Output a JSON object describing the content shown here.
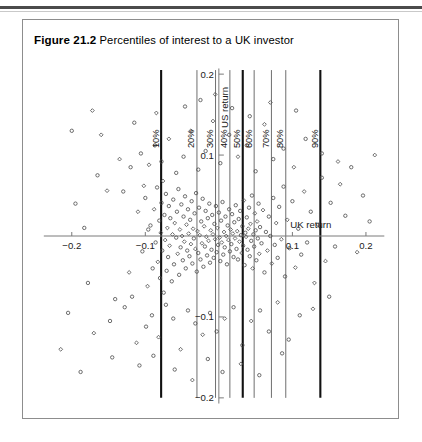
{
  "figure": {
    "caption_label": "Figure 21.2",
    "caption_text": "Percentiles of interest to a UK investor"
  },
  "chart_data": {
    "type": "scatter",
    "title": "Percentiles of interest to a UK investor",
    "xlabel": "UK return",
    "ylabel": "US return",
    "xlim": [
      -0.25,
      0.23
    ],
    "ylim": [
      -0.215,
      0.215
    ],
    "grid": false,
    "legend": null,
    "xticks": [
      -0.2,
      -0.1,
      0.1,
      0.2
    ],
    "xtick_labels": [
      "−0.2",
      "−0.1",
      "0.1",
      "0.2"
    ],
    "yticks": [
      0.2,
      0.1,
      -0.1,
      -0.2
    ],
    "ytick_labels": [
      "0.2",
      "0.1",
      "−0.1",
      "−0.2"
    ],
    "annotations": [
      {
        "label": "10%",
        "x": -0.0785,
        "emphasis": "thick"
      },
      {
        "label": "20%",
        "x": -0.0298,
        "emphasis": "thin"
      },
      {
        "label": "30%",
        "x": -0.0045,
        "emphasis": "thin"
      },
      {
        "label": "40%",
        "x": 0.015,
        "emphasis": "thin"
      },
      {
        "label": "50%",
        "x": 0.0325,
        "emphasis": "thick"
      },
      {
        "label": "60%",
        "x": 0.048,
        "emphasis": "thin"
      },
      {
        "label": "70%",
        "x": 0.0715,
        "emphasis": "thin"
      },
      {
        "label": "80%",
        "x": 0.091,
        "emphasis": "thin"
      },
      {
        "label": "90%",
        "x": 0.138,
        "emphasis": "thick"
      }
    ],
    "percentile_lines_ymin": -0.2,
    "percentile_lines_ymax": 0.205,
    "points": [
      [
        -0.152,
        0.056
      ],
      [
        -0.141,
        -0.078
      ],
      [
        -0.118,
        -0.075
      ],
      [
        -0.11,
        0.03
      ],
      [
        -0.104,
        -0.019
      ],
      [
        -0.1,
        0.047
      ],
      [
        -0.097,
        -0.062
      ],
      [
        -0.093,
        0.013
      ],
      [
        -0.09,
        -0.04
      ],
      [
        -0.088,
        0.033
      ],
      [
        -0.086,
        -0.008
      ],
      [
        -0.084,
        0.06
      ],
      [
        -0.083,
        -0.032
      ],
      [
        -0.081,
        0.019
      ],
      [
        -0.08,
        -0.052
      ],
      [
        -0.079,
        0.004
      ],
      [
        -0.078,
        0.041
      ],
      [
        -0.077,
        -0.018
      ],
      [
        -0.076,
        0.068
      ],
      [
        -0.075,
        -0.07
      ],
      [
        -0.074,
        0.026
      ],
      [
        -0.073,
        -0.005
      ],
      [
        -0.072,
        0.052
      ],
      [
        -0.071,
        -0.043
      ],
      [
        -0.07,
        0.01
      ],
      [
        -0.069,
        -0.026
      ],
      [
        -0.068,
        0.037
      ],
      [
        -0.067,
        -0.012
      ],
      [
        -0.066,
        0.022
      ],
      [
        -0.064,
        -0.056
      ],
      [
        -0.063,
        0.002
      ],
      [
        -0.062,
        0.045
      ],
      [
        -0.061,
        -0.035
      ],
      [
        -0.06,
        0.016
      ],
      [
        -0.058,
        -0.002
      ],
      [
        -0.057,
        0.03
      ],
      [
        -0.056,
        -0.022
      ],
      [
        -0.055,
        0.058
      ],
      [
        -0.054,
        -0.048
      ],
      [
        -0.053,
        0.008
      ],
      [
        -0.052,
        -0.014
      ],
      [
        -0.051,
        0.039
      ],
      [
        -0.05,
        0.0
      ],
      [
        -0.049,
        -0.03
      ],
      [
        -0.048,
        0.024
      ],
      [
        -0.047,
        -0.007
      ],
      [
        -0.046,
        0.049
      ],
      [
        -0.045,
        -0.04
      ],
      [
        -0.044,
        0.014
      ],
      [
        -0.043,
        -0.018
      ],
      [
        -0.042,
        0.033
      ],
      [
        -0.041,
        0.003
      ],
      [
        -0.04,
        -0.025
      ],
      [
        -0.039,
        0.02
      ],
      [
        -0.038,
        -0.01
      ],
      [
        -0.037,
        0.043
      ],
      [
        -0.036,
        -0.034
      ],
      [
        -0.035,
        0.009
      ],
      [
        -0.034,
        -0.003
      ],
      [
        -0.033,
        0.028
      ],
      [
        -0.032,
        -0.016
      ],
      [
        -0.031,
        0.053
      ],
      [
        -0.03,
        -0.044
      ],
      [
        -0.029,
        0.006
      ],
      [
        -0.028,
        -0.021
      ],
      [
        -0.027,
        0.035
      ],
      [
        -0.026,
        0.001
      ],
      [
        -0.025,
        -0.029
      ],
      [
        -0.024,
        0.018
      ],
      [
        -0.023,
        -0.009
      ],
      [
        -0.022,
        0.046
      ],
      [
        -0.021,
        -0.038
      ],
      [
        -0.02,
        0.012
      ],
      [
        -0.019,
        -0.013
      ],
      [
        -0.018,
        0.031
      ],
      [
        -0.017,
        -0.001
      ],
      [
        -0.016,
        -0.024
      ],
      [
        -0.015,
        0.022
      ],
      [
        -0.014,
        -0.006
      ],
      [
        -0.013,
        0.04
      ],
      [
        -0.012,
        -0.033
      ],
      [
        -0.011,
        0.007
      ],
      [
        -0.01,
        -0.017
      ],
      [
        -0.009,
        0.026
      ],
      [
        -0.008,
        0.002
      ],
      [
        -0.007,
        -0.027
      ],
      [
        -0.006,
        0.015
      ],
      [
        -0.005,
        -0.004
      ],
      [
        -0.004,
        0.037
      ],
      [
        -0.003,
        -0.02
      ],
      [
        -0.002,
        0.01
      ],
      [
        -0.001,
        -0.011
      ],
      [
        0.0,
        0.029
      ],
      [
        0.001,
        -0.002
      ],
      [
        0.002,
        -0.031
      ],
      [
        0.003,
        0.019
      ],
      [
        0.004,
        -0.008
      ],
      [
        0.005,
        0.042
      ],
      [
        0.006,
        -0.023
      ],
      [
        0.007,
        0.005
      ],
      [
        0.008,
        -0.014
      ],
      [
        0.009,
        0.024
      ],
      [
        0.01,
        0.0
      ],
      [
        0.011,
        -0.035
      ],
      [
        0.012,
        0.013
      ],
      [
        0.013,
        -0.005
      ],
      [
        0.014,
        0.033
      ],
      [
        0.015,
        -0.019
      ],
      [
        0.016,
        0.008
      ],
      [
        0.017,
        -0.01
      ],
      [
        0.018,
        0.027
      ],
      [
        0.019,
        0.003
      ],
      [
        0.02,
        -0.026
      ],
      [
        0.021,
        0.017
      ],
      [
        0.022,
        -0.003
      ],
      [
        0.023,
        0.038
      ],
      [
        0.024,
        -0.016
      ],
      [
        0.025,
        0.006
      ],
      [
        0.026,
        -0.029
      ],
      [
        0.027,
        0.021
      ],
      [
        0.028,
        -0.007
      ],
      [
        0.029,
        0.031
      ],
      [
        0.03,
        0.001
      ],
      [
        0.031,
        -0.021
      ],
      [
        0.032,
        0.012
      ],
      [
        0.033,
        -0.012
      ],
      [
        0.034,
        0.044
      ],
      [
        0.035,
        -0.036
      ],
      [
        0.036,
        0.004
      ],
      [
        0.037,
        -0.001
      ],
      [
        0.038,
        0.023
      ],
      [
        0.039,
        -0.017
      ],
      [
        0.04,
        0.009
      ],
      [
        0.041,
        0.035
      ],
      [
        0.042,
        -0.025
      ],
      [
        0.043,
        0.015
      ],
      [
        0.044,
        -0.006
      ],
      [
        0.045,
        0.05
      ],
      [
        0.046,
        -0.04
      ],
      [
        0.047,
        0.002
      ],
      [
        0.048,
        -0.013
      ],
      [
        0.049,
        0.028
      ],
      [
        0.05,
        0.007
      ],
      [
        0.051,
        -0.03
      ],
      [
        0.052,
        0.018
      ],
      [
        0.053,
        -0.003
      ],
      [
        0.054,
        0.04
      ],
      [
        0.055,
        -0.022
      ],
      [
        0.056,
        0.011
      ],
      [
        0.058,
        -0.009
      ],
      [
        0.06,
        0.032
      ],
      [
        0.062,
        -0.045
      ],
      [
        0.064,
        0.005
      ],
      [
        0.066,
        -0.018
      ],
      [
        0.068,
        0.024
      ],
      [
        0.07,
        0.0
      ],
      [
        0.072,
        -0.034
      ],
      [
        0.074,
        0.047
      ],
      [
        0.076,
        -0.011
      ],
      [
        0.078,
        0.016
      ],
      [
        0.08,
        -0.027
      ],
      [
        0.082,
        0.036
      ],
      [
        0.085,
        -0.004
      ],
      [
        0.088,
        0.061
      ],
      [
        0.09,
        -0.05
      ],
      [
        0.093,
        0.02
      ],
      [
        0.096,
        -0.015
      ],
      [
        0.1,
        0.043
      ],
      [
        0.104,
        -0.039
      ],
      [
        0.108,
        0.009
      ],
      [
        0.112,
        -0.023
      ],
      [
        0.116,
        0.055
      ],
      [
        0.12,
        -0.008
      ],
      [
        0.125,
        0.03
      ],
      [
        0.13,
        -0.058
      ],
      [
        0.135,
        0.014
      ],
      [
        0.14,
        0.072
      ],
      [
        0.145,
        -0.031
      ],
      [
        0.152,
        0.041
      ],
      [
        0.158,
        -0.013
      ],
      [
        0.165,
        0.064
      ],
      [
        0.172,
        0.025
      ],
      [
        0.18,
        0.085
      ],
      [
        0.188,
        -0.02
      ],
      [
        0.196,
        0.05
      ],
      [
        0.205,
        0.018
      ],
      [
        0.212,
        0.1
      ],
      [
        -0.205,
        -0.095
      ],
      [
        -0.183,
        0.01
      ],
      [
        -0.17,
        -0.12
      ],
      [
        -0.165,
        0.075
      ],
      [
        -0.148,
        -0.105
      ],
      [
        -0.135,
        0.095
      ],
      [
        -0.128,
        -0.088
      ],
      [
        -0.12,
        0.085
      ],
      [
        -0.112,
        -0.132
      ],
      [
        -0.106,
        0.102
      ],
      [
        -0.099,
        -0.112
      ],
      [
        -0.095,
        0.088
      ],
      [
        -0.091,
        -0.098
      ],
      [
        -0.087,
        0.112
      ],
      [
        -0.082,
        -0.125
      ],
      [
        -0.078,
        0.092
      ],
      [
        -0.072,
        -0.085
      ],
      [
        -0.068,
        0.12
      ],
      [
        -0.062,
        -0.102
      ],
      [
        -0.058,
        0.078
      ],
      [
        -0.052,
        -0.14
      ],
      [
        -0.048,
        0.098
      ],
      [
        -0.042,
        -0.092
      ],
      [
        -0.038,
        0.13
      ],
      [
        -0.032,
        -0.108
      ],
      [
        -0.028,
        0.082
      ],
      [
        -0.022,
        -0.122
      ],
      [
        -0.018,
        0.105
      ],
      [
        -0.012,
        -0.095
      ],
      [
        -0.008,
        0.142
      ],
      [
        -0.003,
        -0.118
      ],
      [
        0.002,
        0.09
      ],
      [
        0.008,
        -0.102
      ],
      [
        0.014,
        0.125
      ],
      [
        0.02,
        -0.088
      ],
      [
        0.026,
        0.098
      ],
      [
        0.032,
        -0.135
      ],
      [
        0.038,
        0.112
      ],
      [
        0.044,
        -0.105
      ],
      [
        0.05,
        0.08
      ],
      [
        0.056,
        -0.092
      ],
      [
        0.062,
        0.138
      ],
      [
        0.068,
        -0.118
      ],
      [
        0.074,
        0.095
      ],
      [
        0.08,
        -0.082
      ],
      [
        0.088,
        0.108
      ],
      [
        0.095,
        -0.128
      ],
      [
        0.102,
        0.085
      ],
      [
        0.11,
        -0.098
      ],
      [
        0.118,
        0.12
      ],
      [
        0.128,
        -0.09
      ],
      [
        0.14,
        0.102
      ],
      [
        0.15,
        -0.075
      ],
      [
        0.162,
        0.092
      ],
      [
        -0.195,
        0.04
      ],
      [
        -0.178,
        -0.058
      ],
      [
        -0.16,
        0.125
      ],
      [
        -0.145,
        -0.15
      ],
      [
        -0.13,
        0.055
      ],
      [
        -0.122,
        -0.045
      ],
      [
        -0.115,
        0.14
      ],
      [
        -0.108,
        -0.16
      ],
      [
        -0.102,
        0.062
      ],
      [
        -0.096,
        0.008
      ],
      [
        -0.089,
        -0.148
      ],
      [
        -0.085,
        0.152
      ],
      [
        -0.06,
        -0.165
      ],
      [
        -0.046,
        0.16
      ],
      [
        -0.036,
        -0.178
      ],
      [
        -0.025,
        0.168
      ],
      [
        -0.015,
        -0.152
      ],
      [
        -0.005,
        0.175
      ],
      [
        0.005,
        -0.168
      ],
      [
        0.018,
        0.158
      ],
      [
        0.03,
        -0.158
      ],
      [
        0.042,
        0.148
      ],
      [
        0.055,
        -0.172
      ],
      [
        0.07,
        0.165
      ],
      [
        0.086,
        -0.145
      ],
      [
        0.105,
        0.155
      ],
      [
        -0.215,
        -0.14
      ],
      [
        -0.2,
        0.13
      ],
      [
        -0.188,
        -0.168
      ],
      [
        -0.172,
        0.155
      ]
    ]
  }
}
